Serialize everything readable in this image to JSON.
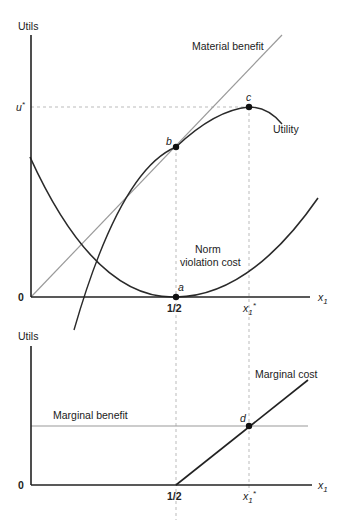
{
  "top_panel": {
    "y_axis_label": "Utils",
    "origin_label": "0",
    "x_axis_label": "x",
    "x_axis_subscript": "1",
    "u_star_label": "u",
    "u_star_sup": "*",
    "half_label": "1/2",
    "x1_star_label": "x",
    "x1_star_sub": "1",
    "x1_star_sup": "*",
    "curves": {
      "material_benefit": "Material benefit",
      "utility": "Utility",
      "norm_cost_line1": "Norm",
      "norm_cost_line2": "violation cost"
    },
    "points": {
      "a": "a",
      "b": "b",
      "c": "c"
    }
  },
  "bottom_panel": {
    "y_axis_label": "Utils",
    "origin_label": "0",
    "x_axis_label": "x",
    "x_axis_subscript": "1",
    "half_label": "1/2",
    "x1_star_label": "x",
    "x1_star_sub": "1",
    "x1_star_sup": "*",
    "curves": {
      "marginal_benefit": "Marginal benefit",
      "marginal_cost": "Marginal cost"
    },
    "points": {
      "d": "d"
    }
  },
  "colors": {
    "axis": "#222222",
    "curve": "#2a2a2a",
    "benefit_line": "#9a9a9a",
    "dashed": "#bbbbbb"
  }
}
